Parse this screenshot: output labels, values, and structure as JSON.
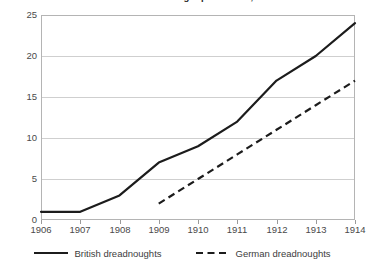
{
  "chart_data": {
    "type": "line",
    "title": "Naval arms race: dreadnought production, 1906–1914",
    "xlabel": "",
    "ylabel": "",
    "x": [
      1906,
      1907,
      1908,
      1909,
      1910,
      1911,
      1912,
      1913,
      1914
    ],
    "xlim": [
      1906,
      1914
    ],
    "ylim": [
      0,
      25
    ],
    "yticks": [
      0,
      5,
      10,
      15,
      20,
      25
    ],
    "xticks": [
      1906,
      1907,
      1908,
      1909,
      1910,
      1911,
      1912,
      1913,
      1914
    ],
    "grid": true,
    "legend_position": "bottom",
    "series": [
      {
        "name": "British dreadnoughts",
        "style": "solid",
        "color": "#1c1c1c",
        "x": [
          1906,
          1907,
          1908,
          1909,
          1910,
          1911,
          1912,
          1913,
          1914
        ],
        "values": [
          1,
          1,
          3,
          7,
          9,
          12,
          17,
          20,
          24
        ]
      },
      {
        "name": "German dreadnoughts",
        "style": "dashed",
        "color": "#1c1c1c",
        "x": [
          1909,
          1910,
          1911,
          1912,
          1913,
          1914
        ],
        "values": [
          2,
          5,
          8,
          11,
          14,
          17
        ]
      }
    ]
  },
  "axes": {
    "y_tick_labels": [
      "25",
      "20",
      "15",
      "10",
      "5",
      "0"
    ],
    "x_tick_labels": [
      "1906",
      "1907",
      "1908",
      "1909",
      "1910",
      "1911",
      "1912",
      "1913",
      "1914"
    ]
  },
  "legend": {
    "items": [
      {
        "label": "British dreadnoughts",
        "style": "solid"
      },
      {
        "label": "German dreadnoughts",
        "style": "dashed"
      }
    ]
  },
  "colors": {
    "series_line": "#1c1c1c",
    "gridline": "#cfcfcf",
    "frame": "#b4b4b4",
    "text": "#3d3d3d",
    "background": "#ffffff"
  }
}
